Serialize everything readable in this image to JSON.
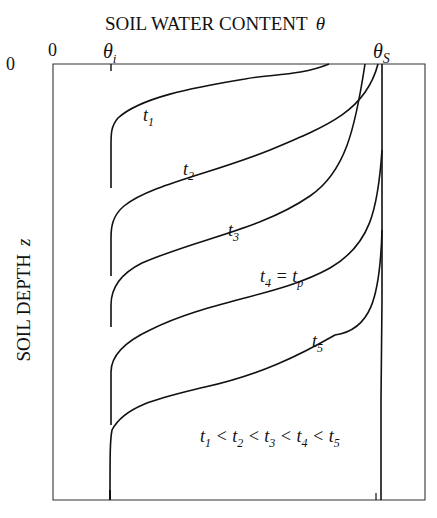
{
  "figure": {
    "title": "SOIL WATER CONTENT",
    "title_symbol": "θ",
    "x_origin_label": "0",
    "y_origin_label": "0",
    "theta_i": {
      "symbol": "θ",
      "subscript": "i"
    },
    "theta_s": {
      "symbol": "θ",
      "subscript": "S"
    },
    "y_axis_label": "SOIL  DEPTH",
    "y_axis_symbol": "z",
    "curves": [
      {
        "name": "t1",
        "label": "t",
        "sub": "1"
      },
      {
        "name": "t2",
        "label": "t",
        "sub": "2"
      },
      {
        "name": "t3",
        "label": "t",
        "sub": "3"
      },
      {
        "name": "t4",
        "label": "t",
        "sub": "4",
        "suffix": " = t",
        "suffix_sub": "p"
      },
      {
        "name": "t5",
        "label": "t",
        "sub": "5"
      }
    ],
    "relation": {
      "parts": [
        "t",
        "1",
        " < t",
        "2",
        " < t",
        "3",
        " < t",
        "4",
        " < t",
        "5"
      ]
    }
  }
}
